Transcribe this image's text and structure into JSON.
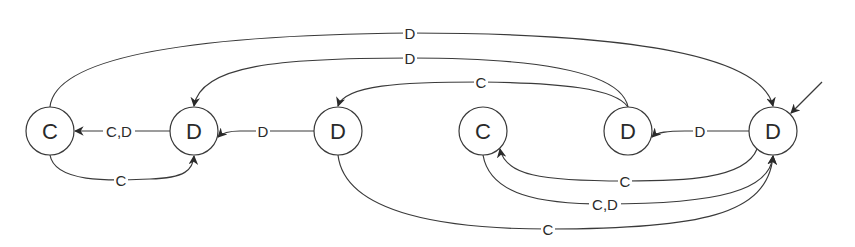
{
  "diagram": {
    "type": "state-machine",
    "colors": {
      "stroke": "#3a3a3a",
      "text": "#2a2a2a",
      "background": "#ffffff"
    },
    "nodes": [
      {
        "id": "n1",
        "label": "C",
        "cx": 50,
        "cy": 131,
        "r": 24
      },
      {
        "id": "n2",
        "label": "D",
        "cx": 194,
        "cy": 131,
        "r": 24
      },
      {
        "id": "n3",
        "label": "D",
        "cx": 338,
        "cy": 131,
        "r": 24
      },
      {
        "id": "n4",
        "label": "C",
        "cx": 483,
        "cy": 131,
        "r": 24
      },
      {
        "id": "n5",
        "label": "D",
        "cx": 628,
        "cy": 131,
        "r": 24
      },
      {
        "id": "n6",
        "label": "D",
        "cx": 773,
        "cy": 131,
        "r": 24,
        "initial": true
      }
    ],
    "edges": [
      {
        "from": "n2",
        "to": "n1",
        "label": "C,D",
        "lx": 119,
        "ly": 131
      },
      {
        "from": "n1",
        "to": "n2",
        "label": "C",
        "lx": 121,
        "ly": 180
      },
      {
        "from": "n3",
        "to": "n2",
        "label": "D",
        "lx": 263,
        "ly": 131
      },
      {
        "from": "n1",
        "to": "n6",
        "label": "D",
        "lx": 410,
        "ly": 33
      },
      {
        "from": "n5",
        "to": "n2",
        "label": "D",
        "lx": 410,
        "ly": 58
      },
      {
        "from": "n5",
        "to": "n3",
        "label": "C",
        "lx": 481,
        "ly": 82
      },
      {
        "from": "n6",
        "to": "n5",
        "label": "D",
        "lx": 700,
        "ly": 131
      },
      {
        "from": "n6",
        "to": "n4",
        "label": "C",
        "lx": 625,
        "ly": 181
      },
      {
        "from": "n4",
        "to": "n6",
        "label": "C,D",
        "lx": 605,
        "ly": 204
      },
      {
        "from": "n3",
        "to": "n6",
        "label": "C",
        "lx": 548,
        "ly": 229
      }
    ],
    "initial_arrow": {
      "to": "n6",
      "x1": 822,
      "y1": 82,
      "x2": 791,
      "y2": 113
    }
  }
}
